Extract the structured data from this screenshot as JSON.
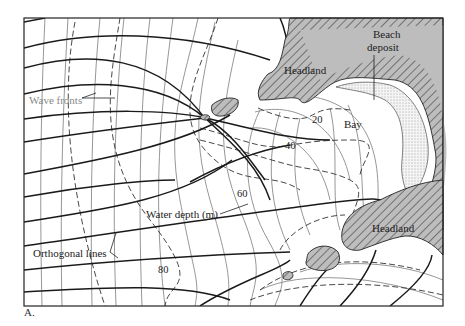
{
  "figure": {
    "caption": "A.",
    "labels": {
      "wave_fronts": "Wave fronts",
      "orthogonal_lines": "Orthogonal lines",
      "water_depth": "Water depth (m)",
      "headland_top": "Headland",
      "headland_bottom": "Headland",
      "beach_deposit_line1": "Beach",
      "beach_deposit_line2": "deposit",
      "bay": "Bay"
    },
    "depth_contours": [
      "20",
      "40",
      "60",
      "80"
    ],
    "colors": {
      "land": "#bdbdbd",
      "orthogonal_lines": "#1a1a1a",
      "wave_fronts": "#8a8a8a",
      "depth_contours": "#333333"
    }
  }
}
